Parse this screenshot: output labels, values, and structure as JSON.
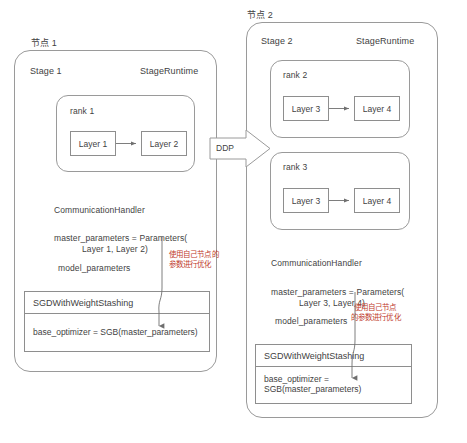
{
  "diagram": {
    "stroke_color": "#9a9a9a",
    "text_color": "#3f3f3f",
    "accent_color": "#c0392b",
    "background": "#ffffff"
  },
  "connector": {
    "label": "DDP",
    "shape": "block-arrow-right"
  },
  "node1": {
    "node_label": "节点 1",
    "stage_label": "Stage 1",
    "runtime_label": "StageRuntime",
    "rank": {
      "label": "rank 1",
      "layers": [
        "Layer 1",
        "Layer 2"
      ]
    },
    "comm_handler": "CommunicationHandler",
    "master_parameters_line1": "master_parameters = Parameters(",
    "master_parameters_line2": "Layer 1, Layer 2)",
    "model_parameters": "model_parameters",
    "annotation_line1": "使用自己节点的",
    "annotation_line2": "参数进行优化",
    "optimizer": {
      "title": "SGDWithWeightStashing",
      "body": "base_optimizer = SGB(master_parameters)"
    }
  },
  "node2": {
    "node_label": "节点 2",
    "stage_label": "Stage 2",
    "runtime_label": "StageRuntime",
    "ranks": [
      {
        "label": "rank 2",
        "layers": [
          "Layer 3",
          "Layer 4"
        ]
      },
      {
        "label": "rank 3",
        "layers": [
          "Layer 3",
          "Layer 4"
        ]
      }
    ],
    "comm_handler": "CommunicationHandler",
    "master_parameters_line1": "master_parameters = Parameters(",
    "master_parameters_line2": "Layer 3, Layer 4)",
    "model_parameters": "model_parameters",
    "annotation_line1": "使用自己节点",
    "annotation_line2": "的参数进行优化",
    "optimizer": {
      "title": "SGDWithWeightStashing",
      "body": "base_optimizer = SGB(master_parameters)"
    }
  }
}
